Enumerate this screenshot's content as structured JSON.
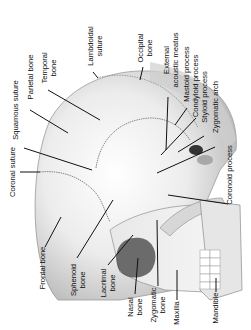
{
  "diagram": {
    "labels": {
      "lambdoidal_suture": [
        "Lambdoidal",
        "suture"
      ],
      "occipital_bone": [
        "Occipital",
        "bone"
      ],
      "temporal_bone": [
        "Temporal",
        "bone"
      ],
      "parietal_bone": [
        "Parietal bone"
      ],
      "squamous_suture": [
        "Squamous suture"
      ],
      "external_acoustic_meatus": [
        "External",
        "acoustic meatus"
      ],
      "mastoid_process": [
        "Mastoid process"
      ],
      "condyloid_process": [
        "Condyloid process"
      ],
      "styloid_process": [
        "Styloid process"
      ],
      "zygomatic_arch": [
        "Zygomatic arch"
      ],
      "coronal_suture": [
        "Coronal suture"
      ],
      "coronoid_process": [
        "Coronoid process"
      ],
      "frontal_bone": [
        "Frontal bone"
      ],
      "sphenoid_bone": [
        "Sphenoid",
        "bone"
      ],
      "lacrimal_bone": [
        "Lacrimal",
        "bone"
      ],
      "nasal_bone": [
        "Nasal",
        "bone"
      ],
      "zygomatic_bone": [
        "Zygomatic",
        "bone"
      ],
      "maxilla": [
        "Maxilla"
      ],
      "mandible": [
        "Mandible"
      ]
    },
    "colors": {
      "background": "#ffffff",
      "bone_light": "#f2f2f2",
      "bone_shade": "#bdbdbd",
      "leader_line": "#111111",
      "text": "#111111"
    }
  }
}
